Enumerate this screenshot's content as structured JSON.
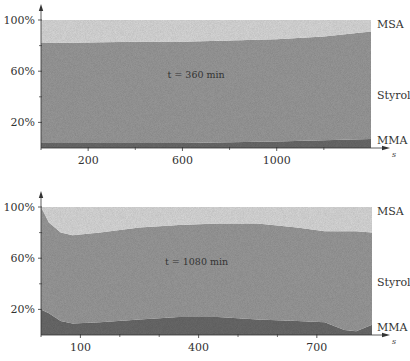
{
  "chart_data": [
    {
      "type": "area",
      "stacked": true,
      "normalized": true,
      "annotation": "t = 360 min",
      "xlabel": "s",
      "ylabel": "",
      "xlim": [
        0,
        1400
      ],
      "ylim": [
        0,
        100
      ],
      "x_ticks": [
        200,
        600,
        1000
      ],
      "x_tick_labels": [
        "200",
        "600",
        "1000"
      ],
      "y_ticks": [
        20,
        60,
        100
      ],
      "y_tick_labels": [
        "20%",
        "60%",
        "100%"
      ],
      "y_minor_ticks": [
        40,
        80
      ],
      "x_minor_ticks": [
        400,
        800,
        1200
      ],
      "grid": false,
      "x": [
        0,
        200,
        400,
        600,
        800,
        1000,
        1200,
        1400
      ],
      "series": [
        {
          "name": "MMA",
          "values": [
            4,
            4,
            4,
            4,
            4.5,
            5,
            6,
            7
          ]
        },
        {
          "name": "Styrol",
          "values": [
            78,
            78.5,
            79,
            79,
            79.5,
            80,
            81,
            84
          ]
        },
        {
          "name": "MSA",
          "values": [
            18,
            17.5,
            17,
            17,
            16,
            15,
            13,
            9
          ]
        }
      ],
      "legend": "right"
    },
    {
      "type": "area",
      "stacked": true,
      "normalized": true,
      "annotation": "t = 1080 min",
      "xlabel": "s",
      "ylabel": "",
      "xlim": [
        0,
        840
      ],
      "ylim": [
        0,
        100
      ],
      "x_ticks": [
        100,
        400,
        700
      ],
      "x_tick_labels": [
        "100",
        "400",
        "700"
      ],
      "y_ticks": [
        20,
        60,
        100
      ],
      "y_tick_labels": [
        "20%",
        "60%",
        "100%"
      ],
      "y_minor_ticks": [
        40,
        80
      ],
      "x_minor_ticks": [
        200,
        300,
        500,
        600
      ],
      "grid": false,
      "x": [
        0,
        20,
        50,
        80,
        150,
        250,
        350,
        450,
        550,
        650,
        720,
        770,
        800,
        840
      ],
      "series": [
        {
          "name": "MMA",
          "values": [
            20,
            17,
            11,
            9,
            10,
            12,
            14,
            14,
            12,
            11,
            10,
            4,
            3,
            8
          ]
        },
        {
          "name": "Styrol",
          "values": [
            80,
            71,
            69,
            69,
            70,
            72,
            72,
            73,
            75,
            73,
            71,
            77,
            78,
            72
          ]
        },
        {
          "name": "MSA",
          "values": [
            0,
            12,
            20,
            22,
            20,
            16,
            14,
            13,
            13,
            16,
            19,
            19,
            19,
            20
          ]
        }
      ],
      "legend": "right"
    }
  ],
  "colors": {
    "MSA": "#d9d9d9",
    "Styrol": "#9a9a9a",
    "MMA": "#6b6b6b",
    "axis": "#333333"
  }
}
